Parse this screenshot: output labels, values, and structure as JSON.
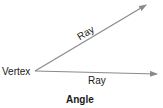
{
  "diagram": {
    "title": "Angle",
    "vertex_label": "Vertex",
    "rays": [
      {
        "label": "Ray",
        "from": [
          35,
          71
        ],
        "to": [
          146,
          5
        ]
      },
      {
        "label": "Ray",
        "from": [
          35,
          71
        ],
        "to": [
          157,
          74
        ]
      }
    ],
    "colors": {
      "line": "#8a8a8a",
      "text": "#1a1a1a"
    }
  }
}
